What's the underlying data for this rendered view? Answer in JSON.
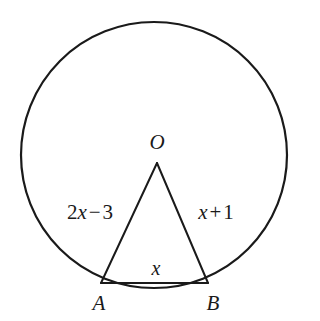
{
  "figure": {
    "type": "circle-with-inscribed-triangle",
    "background_color": "#ffffff",
    "stroke_color": "#1a1a1a",
    "circle": {
      "center_x": 154,
      "center_y": 155,
      "radius": 133,
      "stroke_width": 2.2
    },
    "points": {
      "O": {
        "x": 157,
        "y": 163,
        "label": "O"
      },
      "A": {
        "x": 101,
        "y": 283,
        "label": "A"
      },
      "B": {
        "x": 208,
        "y": 283,
        "label": "B"
      }
    },
    "segments": [
      {
        "name": "OA",
        "from": "O",
        "to": "A"
      },
      {
        "name": "OB",
        "from": "O",
        "to": "B"
      },
      {
        "name": "AB",
        "from": "A",
        "to": "B"
      }
    ],
    "labels": {
      "left_side": {
        "text": "2x − 3",
        "coefficient": "2",
        "variable": "x",
        "operator": "−",
        "constant": "3"
      },
      "right_side": {
        "text": "x + 1",
        "variable": "x",
        "operator": "+",
        "constant": "1"
      },
      "base": {
        "text": "x",
        "variable": "x"
      },
      "vertex_o": "O",
      "vertex_a": "A",
      "vertex_b": "B"
    }
  }
}
